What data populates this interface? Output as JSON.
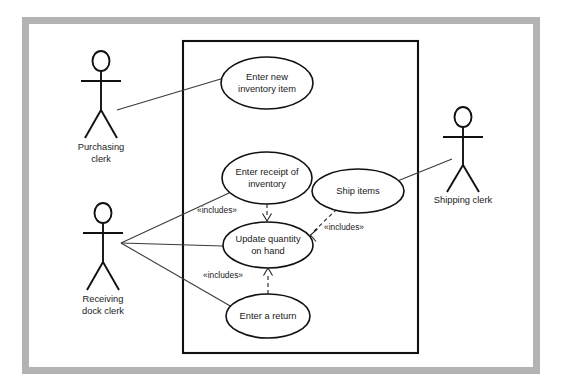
{
  "diagram": {
    "kind": "uml-use-case-diagram",
    "canvas": {
      "width": 563,
      "height": 389
    },
    "colors": {
      "background": "#ffffff",
      "frame": "#b3b3b3",
      "stroke": "#111111",
      "association": "#3a3a3a",
      "text": "#1a1a1a"
    },
    "system_boundary": {
      "x": 183,
      "y": 41,
      "width": 235,
      "height": 312
    },
    "actors": [
      {
        "id": "purchasing-clerk",
        "label_line1": "Purchasing",
        "label_line2": "clerk",
        "x": 101,
        "y": 61
      },
      {
        "id": "receiving-dock-clerk",
        "label_line1": "Receiving",
        "label_line2": "dock clerk",
        "x": 103,
        "y": 213
      },
      {
        "id": "shipping-clerk",
        "label_line1": "Shipping clerk",
        "label_line2": "",
        "x": 463,
        "y": 117
      }
    ],
    "use_cases": [
      {
        "id": "enter-new-inventory-item",
        "label_line1": "Enter new",
        "label_line2": "inventory item",
        "cx": 267,
        "cy": 83,
        "rx": 46,
        "ry": 26
      },
      {
        "id": "enter-receipt-of-inventory",
        "label_line1": "Enter receipt of",
        "label_line2": "inventory",
        "cx": 267,
        "cy": 178,
        "rx": 45,
        "ry": 26
      },
      {
        "id": "ship-items",
        "label_line1": "Ship items",
        "label_line2": "",
        "cx": 358,
        "cy": 191,
        "rx": 46,
        "ry": 22
      },
      {
        "id": "update-quantity-on-hand",
        "label_line1": "Update quantity",
        "label_line2": "on hand",
        "cx": 268,
        "cy": 245,
        "rx": 45,
        "ry": 23
      },
      {
        "id": "enter-a-return",
        "label_line1": "Enter a return",
        "label_line2": "",
        "cx": 268,
        "cy": 316,
        "rx": 42,
        "ry": 22
      }
    ],
    "associations": [
      {
        "from": "purchasing-clerk",
        "to": "enter-new-inventory-item"
      },
      {
        "from": "receiving-dock-clerk",
        "to": "enter-receipt-of-inventory"
      },
      {
        "from": "receiving-dock-clerk",
        "to": "update-quantity-on-hand"
      },
      {
        "from": "receiving-dock-clerk",
        "to": "enter-a-return"
      },
      {
        "from": "shipping-clerk",
        "to": "ship-items"
      }
    ],
    "includes": [
      {
        "id": "include-receipt-to-update",
        "from": "enter-receipt-of-inventory",
        "to": "update-quantity-on-hand",
        "label": "«includes»",
        "label_x": 217,
        "label_y": 213
      },
      {
        "id": "include-ship-to-update",
        "from": "ship-items",
        "to": "update-quantity-on-hand",
        "label": "«includes»",
        "label_x": 344,
        "label_y": 230
      },
      {
        "id": "include-return-to-update",
        "from": "enter-a-return",
        "to": "update-quantity-on-hand",
        "label": "«includes»",
        "label_x": 223,
        "label_y": 278
      }
    ]
  }
}
